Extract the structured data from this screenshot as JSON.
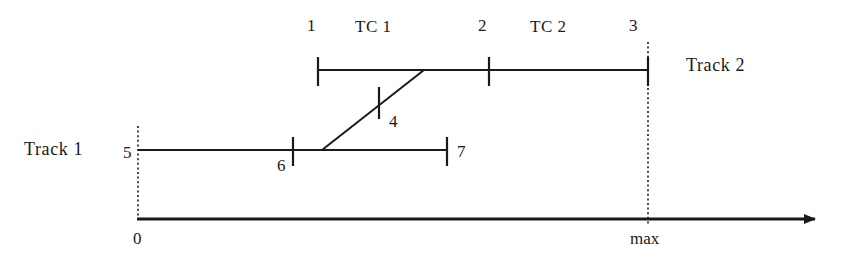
{
  "diagram": {
    "colors": {
      "line": "#1a1a1a",
      "text": "#1a1a1a",
      "background": "#ffffff"
    },
    "track2": {
      "name": "Track 2",
      "label": "Track 2",
      "start_label": "1",
      "mid_label": "2",
      "end_label": "3",
      "segments": [
        {
          "name": "TC 1",
          "label": "TC 1"
        },
        {
          "name": "TC 2",
          "label": "TC 2"
        }
      ]
    },
    "track1": {
      "name": "Track 1",
      "label": "Track 1",
      "start_label": "5",
      "mid_label": "6",
      "end_label": "7"
    },
    "transition": {
      "label": "4"
    },
    "axis": {
      "origin_label": "0",
      "max_label": "max"
    }
  }
}
